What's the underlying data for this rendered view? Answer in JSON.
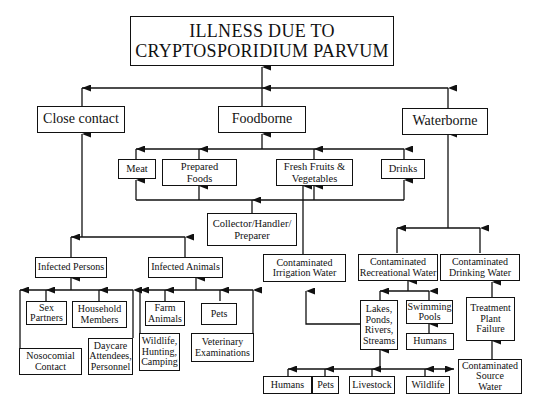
{
  "diagram": {
    "title": "ILLNESS DUE TO\nCRYPTOSPORIDIUM PARVUM",
    "categories": {
      "close_contact": "Close contact",
      "foodborne": "Foodborne",
      "waterborne": "Waterborne"
    },
    "food": {
      "meat": "Meat",
      "prepared_foods": "Prepared\nFoods",
      "fresh_fruits": "Fresh Fruits &\nVegetables",
      "drinks": "Drinks",
      "collector": "Collector/Handler/\nPreparer"
    },
    "contact": {
      "infected_persons": "Infected Persons",
      "infected_animals": "Infected Animals",
      "sex_partners": "Sex\nPartners",
      "household_members": "Household\nMembers",
      "nosocomial": "Nosocomial\nContact",
      "daycare": "Daycare\nAttendees,\nPersonnel",
      "farm_animals": "Farm\nAnimals",
      "pets": "Pets",
      "wildlife_hunting": "Wildlife,\nHunting,\nCamping",
      "veterinary": "Veterinary\nExaminations"
    },
    "water": {
      "irrigation": "Contaminated\nIrrigation Water",
      "recreational": "Contaminated\nRecreational Water",
      "drinking": "Contaminated\nDrinking Water",
      "lakes": "Lakes,\nPonds,\nRivers,\nStreams",
      "swimming_pools": "Swimming\nPools",
      "pool_humans": "Humans",
      "treatment_failure": "Treatment\nPlant\nFailure",
      "source_water": "Contaminated\nSource\nWater",
      "humans": "Humans",
      "pets": "Pets",
      "livestock": "Livestock",
      "wildlife": "Wildlife"
    }
  }
}
